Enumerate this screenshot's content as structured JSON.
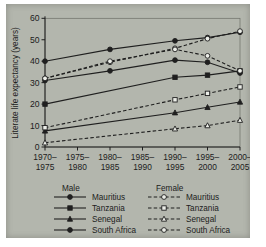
{
  "figure": {
    "background_color": "#b3b6ad",
    "ink_color": "#1f1f1f",
    "open_marker_fill": "#eceee8"
  },
  "chart_data": {
    "type": "line",
    "title": "",
    "xlabel": "",
    "ylabel": "Literate life expectancy (years)",
    "ylim": [
      0,
      60
    ],
    "yticks": [
      0,
      10,
      20,
      30,
      40,
      50,
      60
    ],
    "grid": false,
    "categories": [
      "1970–1975",
      "1975–1980",
      "1980–1985",
      "1985–1990",
      "1990–1995",
      "1995–2000",
      "2000–2005"
    ],
    "series": [
      {
        "name": "Mauritius (male)",
        "country": "Mauritius",
        "sex": "male",
        "line": "solid",
        "marker": "circle",
        "fill": "filled",
        "values": [
          40,
          null,
          45.5,
          null,
          49.5,
          51,
          53.5
        ]
      },
      {
        "name": "Tanzania (male)",
        "country": "Tanzania",
        "sex": "male",
        "line": "solid",
        "marker": "square",
        "fill": "filled",
        "values": [
          20,
          null,
          null,
          null,
          32.5,
          33.5,
          35.5
        ]
      },
      {
        "name": "Senegal (male)",
        "country": "Senegal",
        "sex": "male",
        "line": "solid",
        "marker": "triangle",
        "fill": "filled",
        "values": [
          7.5,
          null,
          null,
          null,
          16,
          18.5,
          21
        ]
      },
      {
        "name": "South Africa (male)",
        "country": "South Africa",
        "sex": "male",
        "line": "solid",
        "marker": "circle",
        "fill": "filled",
        "values": [
          31,
          null,
          35.5,
          null,
          40.5,
          39.5,
          34.5
        ]
      },
      {
        "name": "Mauritius (female)",
        "country": "Mauritius",
        "sex": "female",
        "line": "dashed",
        "marker": "circle",
        "fill": "open",
        "values": [
          32,
          null,
          39.5,
          null,
          46,
          50.5,
          54
        ]
      },
      {
        "name": "Tanzania (female)",
        "country": "Tanzania",
        "sex": "female",
        "line": "dashed",
        "marker": "square",
        "fill": "open",
        "values": [
          9,
          null,
          null,
          null,
          22,
          25,
          28
        ]
      },
      {
        "name": "Senegal (female)",
        "country": "Senegal",
        "sex": "female",
        "line": "dashed",
        "marker": "triangle",
        "fill": "open",
        "values": [
          2,
          null,
          null,
          null,
          8.5,
          10,
          12.5
        ]
      },
      {
        "name": "South Africa (female)",
        "country": "South Africa",
        "sex": "female",
        "line": "dashed",
        "marker": "circle",
        "fill": "open",
        "values": [
          32,
          null,
          40,
          null,
          45.5,
          42.5,
          35.5
        ]
      }
    ],
    "legend": {
      "position": "bottom",
      "columns": [
        {
          "header": "Male",
          "sex": "male",
          "items": [
            "Mauritius",
            "Tanzania",
            "Senegal",
            "South Africa"
          ]
        },
        {
          "header": "Female",
          "sex": "female",
          "items": [
            "Mauritius",
            "Tanzania",
            "Senegal",
            "South Africa"
          ]
        }
      ]
    }
  }
}
